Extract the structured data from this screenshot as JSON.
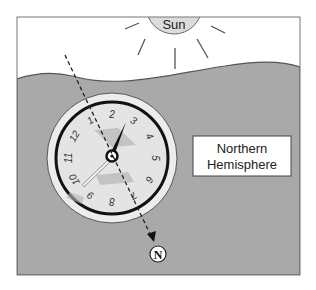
{
  "diagram": {
    "sun": {
      "label": "Sun",
      "fill": "#dcdcdc"
    },
    "ground": {
      "fill": "#a9a9a9"
    },
    "hemisphere_label": {
      "line1": "Northern",
      "line2": "Hemisphere"
    },
    "north_marker": {
      "label": "N"
    },
    "watch": {
      "numbers": [
        "1",
        "2",
        "3",
        "4",
        "5",
        "6",
        "7",
        "8",
        "9",
        "10",
        "11",
        "12"
      ],
      "face_fill": "#e6e6e6",
      "rim_fill": "#ececec",
      "hour_hand_color": "#111111",
      "minute_hand_color": "#f4f4f4"
    },
    "dashed_line": {
      "description": "line from sun direction bisecting watch toward north"
    }
  }
}
